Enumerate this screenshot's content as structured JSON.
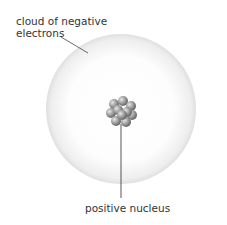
{
  "diagram": {
    "labels": {
      "cloud_line1": "cloud of negative",
      "cloud_line2": "electrons",
      "nucleus": "positive nucleus"
    },
    "colors": {
      "cloud_ring": "#c8c8c8",
      "nucleus": "#8a8a8a",
      "text": "#333333",
      "leader_line": "#444444"
    }
  }
}
